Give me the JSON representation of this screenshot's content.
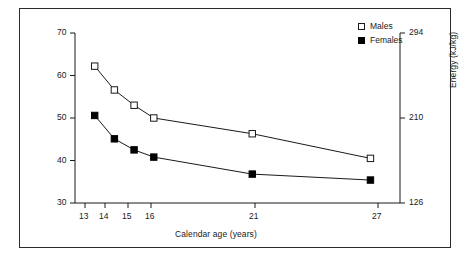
{
  "chart_data": {
    "type": "line",
    "title": "",
    "subtitle": "",
    "xlabel": "Calendar age (years)",
    "ylabel": "Energy (kcal/kg)",
    "ylabel_right": "Energy (kJ/kg)",
    "x": [
      13,
      14,
      15,
      16,
      21,
      27
    ],
    "categories": [
      "13",
      "14",
      "15",
      "16",
      "21",
      "27"
    ],
    "xtick_labels": [
      "13",
      "14",
      "15",
      "16",
      "21",
      "27"
    ],
    "ytick_labels": [
      "30",
      "40",
      "50",
      "60",
      "70"
    ],
    "ytick_values": [
      30,
      40,
      50,
      60,
      70
    ],
    "ytick_labels_right": [
      "126",
      "210",
      "294"
    ],
    "ytick_values_right": [
      126,
      210,
      294
    ],
    "xlim": [
      12,
      28.5
    ],
    "ylim": [
      30,
      70
    ],
    "ylim_right": [
      126,
      294
    ],
    "grid": false,
    "legend_position": "top-right",
    "series": [
      {
        "name": "Males",
        "marker": "open-square",
        "color": "#1a1a1a",
        "values": [
          62.2,
          56.6,
          53.0,
          50.0,
          46.3,
          40.5
        ]
      },
      {
        "name": "Females",
        "marker": "filled-square",
        "color": "#000000",
        "values": [
          50.6,
          45.1,
          42.5,
          40.8,
          36.8,
          35.4
        ]
      }
    ]
  },
  "legend": {
    "males_label": "Males",
    "females_label": "Females"
  },
  "axes": {
    "x_title": "Calendar age (years)",
    "y_left_title": "Energy (kcal/kg)",
    "y_right_title": "Energy (kJ/kg)"
  },
  "colors": {
    "frame": "#2b2b2b",
    "axis": "#1a1a1a",
    "line": "#1a1a1a",
    "background": "#ffffff"
  }
}
